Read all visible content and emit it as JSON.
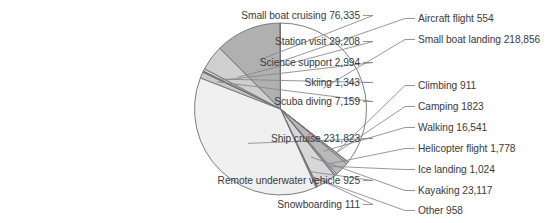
{
  "chart_data": {
    "type": "pie",
    "title": "",
    "subtitle": "",
    "xlabel": "",
    "ylabel": "",
    "legend_position": "none",
    "grid": false,
    "label_format": "name value",
    "total": 615409,
    "categories": [
      "Small boat landing",
      "Climbing",
      "Camping",
      "Walking",
      "Helicopter flight",
      "Ice landing",
      "Kayaking",
      "Other",
      "Snowboarding",
      "Remote underwater vehicle",
      "Ship cruise",
      "Scuba diving",
      "Skiing",
      "Science support",
      "Station visit",
      "Small boat cruising",
      "Aircraft flight"
    ],
    "values": [
      218856,
      911,
      1823,
      16541,
      1778,
      1024,
      23117,
      958,
      111,
      925,
      231823,
      7159,
      1343,
      2994,
      29208,
      76335,
      554
    ],
    "slices": [
      {
        "name": "Small boat landing",
        "value": 218856,
        "value_text": "218,856",
        "label": "Small boat landing 218,856",
        "color": "#fefefe"
      },
      {
        "name": "Climbing",
        "value": 911,
        "value_text": "911",
        "label": "Climbing 911",
        "color": "#f6f6f6"
      },
      {
        "name": "Camping",
        "value": 1823,
        "value_text": "1823",
        "label": "Camping 1823",
        "color": "#ededed"
      },
      {
        "name": "Walking",
        "value": 16541,
        "value_text": "16,541",
        "label": "Walking 16,541",
        "color": "#b9b9b9"
      },
      {
        "name": "Helicopter flight",
        "value": 1778,
        "value_text": "1,778",
        "label": "Helicopter flight 1,778",
        "color": "#e8e8e8"
      },
      {
        "name": "Ice landing",
        "value": 1024,
        "value_text": "1,024",
        "label": "Ice landing 1,024",
        "color": "#f2f2f2"
      },
      {
        "name": "Kayaking",
        "value": 23117,
        "value_text": "23,117",
        "label": "Kayaking 23,117",
        "color": "#d7d7d7"
      },
      {
        "name": "Other",
        "value": 958,
        "value_text": "958",
        "label": "Other 958",
        "color": "#f4f4f4"
      },
      {
        "name": "Snowboarding",
        "value": 111,
        "value_text": "111",
        "label": "Snowboarding 111",
        "color": "#fbfbfb"
      },
      {
        "name": "Remote underwater vehicle",
        "value": 925,
        "value_text": "925",
        "label": "Remote underwater vehicle 925",
        "color": "#f7f7f7"
      },
      {
        "name": "Ship cruise",
        "value": 231823,
        "value_text": "231,823",
        "label": "Ship cruise 231,823",
        "color": "#f0f0f0"
      },
      {
        "name": "Scuba diving",
        "value": 7159,
        "value_text": "7,159",
        "label": "Scuba diving 7,159",
        "color": "#c9c9c9"
      },
      {
        "name": "Skiing",
        "value": 1343,
        "value_text": "1,343",
        "label": "Skiing 1,343",
        "color": "#7b7b7b"
      },
      {
        "name": "Science support",
        "value": 2994,
        "value_text": "2,994",
        "label": "Science support 2,994",
        "color": "#d2d2d2"
      },
      {
        "name": "Station visit",
        "value": 29208,
        "value_text": "29,208",
        "label": "Station visit 29,208",
        "color": "#cfcfcf"
      },
      {
        "name": "Small boat cruising",
        "value": 76335,
        "value_text": "76,335",
        "label": "Small boat cruising 76,335",
        "color": "#b0b0b0"
      },
      {
        "name": "Aircraft flight",
        "value": 554,
        "value_text": "554",
        "label": "Aircraft flight 554",
        "color": "#fdfdfd"
      }
    ]
  },
  "labels": {
    "left": [
      {
        "text": "Small boat cruising 76,335",
        "right_px": 360,
        "top_px": 10
      },
      {
        "text": "Station visit 29,208",
        "right_px": 360,
        "top_px": 36
      },
      {
        "text": "Science support 2,994",
        "right_px": 360,
        "top_px": 57
      },
      {
        "text": "Skiing 1,343",
        "right_px": 360,
        "top_px": 77
      },
      {
        "text": "Scuba diving 7,159",
        "right_px": 360,
        "top_px": 96
      },
      {
        "text": "Ship cruise 231,823",
        "right_px": 360,
        "top_px": 133
      },
      {
        "text": "Remote underwater vehicle 925",
        "right_px": 360,
        "top_px": 175
      },
      {
        "text": "Snowboarding 111",
        "right_px": 360,
        "top_px": 199
      }
    ],
    "right": [
      {
        "text": "Aircraft flight 554",
        "left_px": 418,
        "top_px": 13
      },
      {
        "text": "Small boat landing 218,856",
        "left_px": 418,
        "top_px": 34
      },
      {
        "text": "Climbing 911",
        "left_px": 418,
        "top_px": 80
      },
      {
        "text": "Camping 1823",
        "left_px": 418,
        "top_px": 101
      },
      {
        "text": "Walking 16,541",
        "left_px": 418,
        "top_px": 122
      },
      {
        "text": "Helicopter flight 1,778",
        "left_px": 418,
        "top_px": 143
      },
      {
        "text": "Ice landing 1,024",
        "left_px": 418,
        "top_px": 164
      },
      {
        "text": "Kayaking 23,117",
        "left_px": 418,
        "top_px": 185
      },
      {
        "text": "Other 958",
        "left_px": 418,
        "top_px": 205
      }
    ]
  },
  "style": {
    "text_color": "#3a3a3c",
    "stroke_color": "#6f6f74",
    "leader_color": "#85858a",
    "background": "#ffffff"
  },
  "geometry": {
    "center_x": 280.5,
    "center_y": 109,
    "radius": 86,
    "start_angle_deg": -90,
    "direction": "clockwise"
  }
}
